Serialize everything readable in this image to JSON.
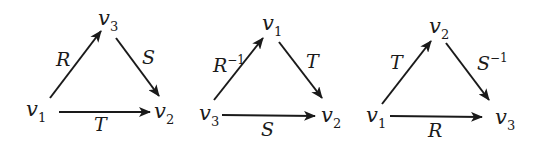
{
  "diagrams": [
    {
      "nodes": {
        "top": {
          "base": "v",
          "sub": "3"
        },
        "left": {
          "base": "v",
          "sub": "1"
        },
        "right": {
          "base": "v",
          "sub": "2"
        }
      },
      "edges": {
        "left_to_top": {
          "base": "R",
          "sup": ""
        },
        "top_to_right": {
          "base": "S",
          "sup": ""
        },
        "left_to_right": {
          "base": "T",
          "sup": ""
        }
      }
    },
    {
      "nodes": {
        "top": {
          "base": "v",
          "sub": "1"
        },
        "left": {
          "base": "v",
          "sub": "3"
        },
        "right": {
          "base": "v",
          "sub": "2"
        }
      },
      "edges": {
        "left_to_top": {
          "base": "R",
          "sup": "−1"
        },
        "top_to_right": {
          "base": "T",
          "sup": ""
        },
        "left_to_right": {
          "base": "S",
          "sup": ""
        }
      }
    },
    {
      "nodes": {
        "top": {
          "base": "v",
          "sub": "2"
        },
        "left": {
          "base": "v",
          "sub": "1"
        },
        "right": {
          "base": "v",
          "sub": "3"
        }
      },
      "edges": {
        "left_to_top": {
          "base": "T",
          "sup": ""
        },
        "top_to_right": {
          "base": "S",
          "sup": "−1"
        },
        "left_to_right": {
          "base": "R",
          "sup": ""
        }
      }
    }
  ]
}
